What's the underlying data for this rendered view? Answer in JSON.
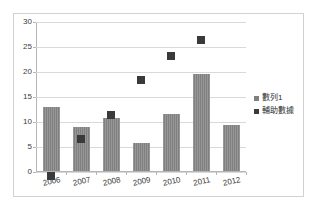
{
  "chart_data": {
    "type": "bar",
    "title": "",
    "subtitle": "",
    "xlabel": "",
    "ylabel": "",
    "categories": [
      "2006",
      "2007",
      "2008",
      "2009",
      "2010",
      "2011",
      "2012"
    ],
    "ylim": [
      0,
      30
    ],
    "yticks": [
      0,
      5,
      10,
      15,
      20,
      25,
      30
    ],
    "ytick_labels": [
      "0",
      "5",
      "10",
      "15",
      "20",
      "25",
      "30"
    ],
    "grid": true,
    "legend_position": "right",
    "series": [
      {
        "name": "數列1",
        "type": "bar",
        "color": "#808080",
        "values": [
          12.8,
          8.8,
          10.7,
          5.6,
          11.5,
          19.4,
          9.3
        ]
      },
      {
        "name": "輔助數據",
        "type": "scatter",
        "marker": "square",
        "color": "#3a3a3a",
        "values": [
          0,
          7.5,
          12.3,
          19.2,
          24.1,
          27.3,
          null
        ]
      }
    ]
  },
  "legend": {
    "items": [
      {
        "label": "數列1"
      },
      {
        "label": "輔助數據"
      }
    ]
  },
  "colors": {
    "bar": "#808080",
    "marker": "#3a3a3a",
    "grid": "#d9d9d9",
    "axis": "#b5b5b5",
    "border": "#d2d2d2",
    "background": "#ffffff"
  }
}
